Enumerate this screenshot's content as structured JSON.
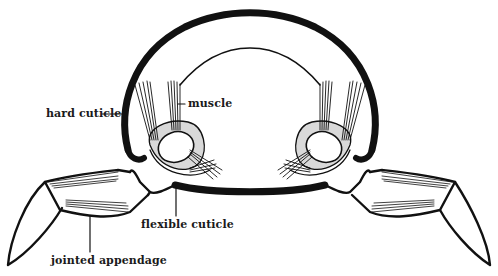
{
  "diagram": {
    "type": "labeled-anatomical-cross-section",
    "colors": {
      "ink": "#111111",
      "shading": "#d9d9d9",
      "background": "#ffffff"
    },
    "labels": {
      "hard_cuticle": "hard cuticle",
      "muscle": "muscle",
      "flexible_cuticle": "flexible cuticle",
      "jointed_appendage": "jointed appendage"
    }
  }
}
